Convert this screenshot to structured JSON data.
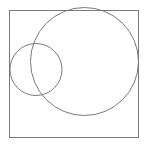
{
  "diagram": {
    "stroke_color": "#7a7a7a",
    "background": "#ffffff",
    "frame": {
      "x": 9.5,
      "y": 10.5,
      "width": 129,
      "height": 127
    },
    "circles": [
      {
        "name": "large-circle",
        "cx": 84.5,
        "cy": 61.5,
        "r": 54
      },
      {
        "name": "small-circle",
        "cx": 36,
        "cy": 69.5,
        "r": 26
      }
    ]
  }
}
